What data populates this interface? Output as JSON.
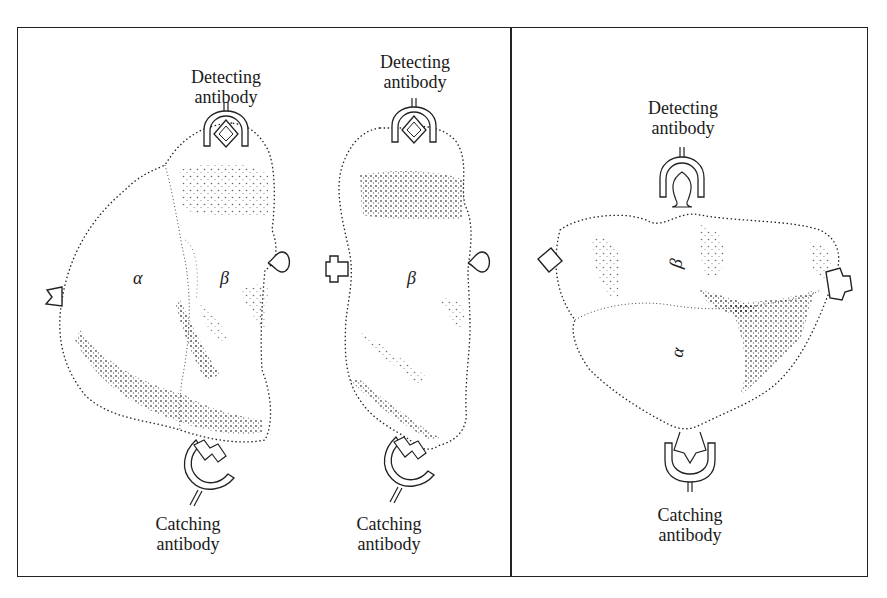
{
  "figure": {
    "panels": [
      {
        "id": "left",
        "description": "Hybrid molecule with alpha and beta subunits",
        "labels": {
          "detecting": "Detecting antibody",
          "catching": "Catching antibody",
          "subunit_alpha": "α",
          "subunit_beta": "β"
        }
      },
      {
        "id": "middle",
        "description": "Single beta subunit",
        "labels": {
          "detecting": "Detecting antibody",
          "catching": "Catching antibody",
          "subunit_beta": "β"
        }
      },
      {
        "id": "right",
        "description": "Rotated alpha-beta complex",
        "labels": {
          "detecting": "Detecting antibody",
          "catching": "Catching antibody",
          "subunit_alpha": "α",
          "subunit_beta": "β"
        }
      }
    ]
  }
}
